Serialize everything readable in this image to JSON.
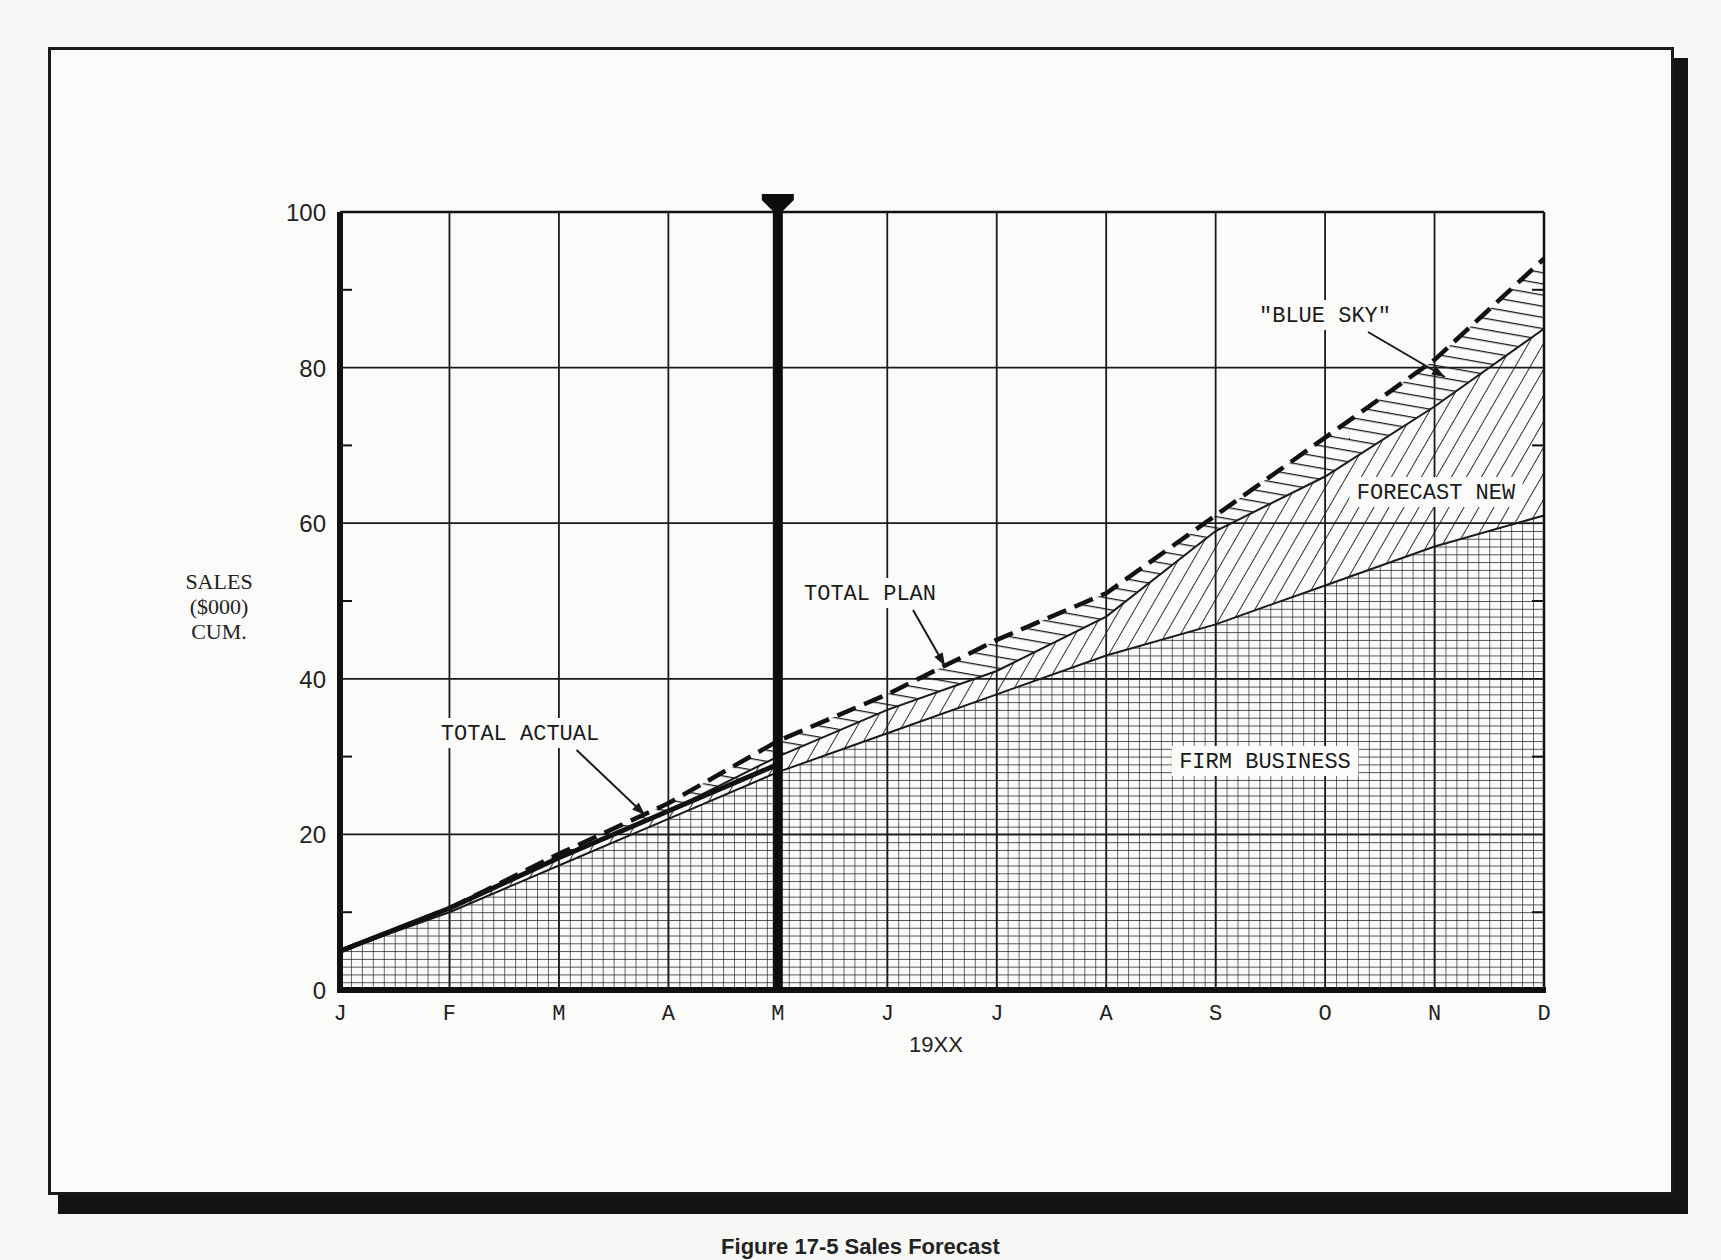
{
  "chart_data": {
    "type": "area",
    "title": "",
    "xlabel": "19XX",
    "ylabel": [
      "SALES",
      "($000)",
      "CUM."
    ],
    "ylim": [
      0,
      100
    ],
    "yticks": [
      0,
      20,
      40,
      60,
      80,
      100
    ],
    "yminor_ticks": [
      10,
      30,
      50,
      70,
      90
    ],
    "grid": true,
    "categories": [
      "J",
      "F",
      "M",
      "A",
      "M",
      "J",
      "J",
      "A",
      "S",
      "O",
      "N",
      "D"
    ],
    "current_marker_index": 4,
    "series": [
      {
        "name": "FIRM BUSINESS",
        "fill": "crosshatch-grid",
        "values": [
          5,
          10,
          16,
          22,
          28,
          33,
          38,
          43,
          47,
          52,
          57,
          61
        ]
      },
      {
        "name": "FORECAST NEW",
        "fill": "diagonal-hatch",
        "cumulative_top": true,
        "values": [
          5,
          10.5,
          17,
          23,
          30,
          36,
          41,
          48,
          59,
          66,
          75,
          85
        ]
      },
      {
        "name": "\"BLUE SKY\"",
        "fill": "horizontal-hatch",
        "cumulative_top": true,
        "values": [
          5,
          10.5,
          17.5,
          24,
          32,
          38,
          45,
          51,
          61,
          71,
          81,
          94
        ]
      }
    ],
    "lines": [
      {
        "name": "TOTAL ACTUAL",
        "style": "solid",
        "values": [
          5,
          10.5,
          17,
          23,
          29
        ]
      },
      {
        "name": "TOTAL PLAN",
        "style": "dashed",
        "values": [
          5,
          10.5,
          17.5,
          24,
          32,
          38,
          45,
          51,
          61,
          71,
          81,
          94
        ]
      }
    ],
    "annotations": [
      {
        "text": "TOTAL ACTUAL",
        "label_pos": [
          520,
          740
        ],
        "arrow_to": [
          645,
          815
        ]
      },
      {
        "text": "TOTAL PLAN",
        "label_pos": [
          870,
          600
        ],
        "arrow_to": [
          945,
          666
        ]
      },
      {
        "text": "\"BLUE SKY\"",
        "label_pos": [
          1325,
          322
        ],
        "arrow_to": [
          1445,
          377
        ]
      },
      {
        "text": "FORECAST NEW",
        "label_pos": [
          1436,
          499
        ]
      },
      {
        "text": "FIRM BUSINESS",
        "label_pos": [
          1265,
          768
        ]
      }
    ]
  },
  "caption": "Figure 17-5 Sales Forecast"
}
